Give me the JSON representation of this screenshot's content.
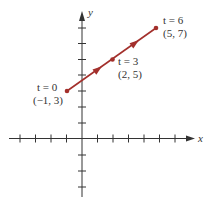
{
  "diagram": {
    "type": "parametric-line-segment",
    "colors": {
      "axis": "#333333",
      "segment": "#a3302c",
      "label": "#333333"
    },
    "axes": {
      "x_label": "x",
      "y_label": "y",
      "x_ticks": [
        -5,
        -4,
        -3,
        -2,
        -1,
        1,
        2,
        3,
        4,
        5,
        6
      ],
      "y_ticks": [
        -3,
        -2,
        -1,
        1,
        2,
        3,
        4,
        5,
        6,
        7
      ]
    },
    "points": [
      {
        "t_label": "t = 0",
        "coord_label": "(−1, 3)",
        "x": -1,
        "y": 3
      },
      {
        "t_label": "t = 3",
        "coord_label": "(2, 5)",
        "x": 2,
        "y": 5
      },
      {
        "t_label": "t = 6",
        "coord_label": "(5, 7)",
        "x": 5,
        "y": 7
      }
    ],
    "direction_arrows": 2
  }
}
